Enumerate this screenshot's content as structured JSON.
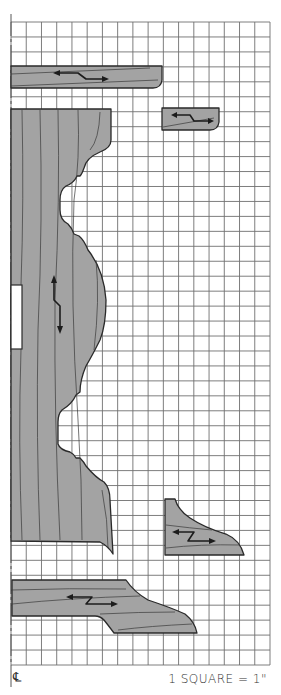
{
  "diagram": {
    "type": "woodworking-pattern-grid",
    "scale_label": "1 SQUARE = 1\"",
    "centerline_symbol": "℄",
    "grid": {
      "columns": 17,
      "rows": 43,
      "cell_px": 15.1,
      "color": "#6f6f6f"
    },
    "colors": {
      "piece_fill": "#a3a3a3",
      "outline": "#2a2a2a",
      "background": "#ffffff"
    },
    "pieces": [
      {
        "id": "top-shelf",
        "grain_direction": "horizontal"
      },
      {
        "id": "small-block",
        "grain_direction": "horizontal"
      },
      {
        "id": "pedestal-column",
        "grain_direction": "vertical",
        "has_mortise": true
      },
      {
        "id": "bracket",
        "grain_direction": "horizontal"
      },
      {
        "id": "foot",
        "grain_direction": "horizontal"
      }
    ]
  }
}
